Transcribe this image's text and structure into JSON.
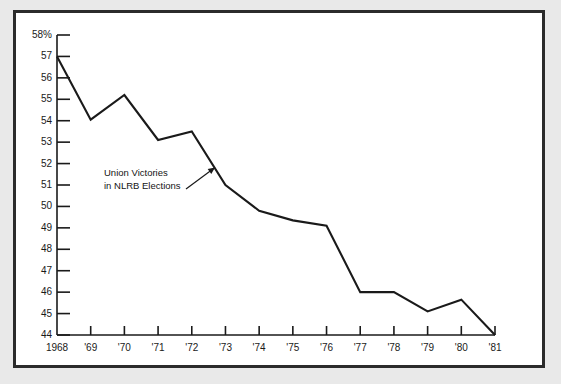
{
  "chart_data": {
    "type": "line",
    "title": "",
    "annotation": {
      "line1": "Union Victories",
      "line2": "in NLRB Elections"
    },
    "xlabel": "",
    "ylabel": "",
    "categories": [
      "1968",
      "'69",
      "'70",
      "'71",
      "'72",
      "'73",
      "'74",
      "'75",
      "'76",
      "'77",
      "'78",
      "'79",
      "'80",
      "'81"
    ],
    "values": [
      57.0,
      54.05,
      55.2,
      53.1,
      53.5,
      51.0,
      49.8,
      49.35,
      49.1,
      46.0,
      46.0,
      45.1,
      45.65,
      44.0
    ],
    "ylim": [
      44,
      58
    ],
    "ytick_labels": [
      "58%",
      "57",
      "56",
      "55",
      "54",
      "53",
      "52",
      "51",
      "50",
      "49",
      "48",
      "47",
      "46",
      "45",
      "44"
    ],
    "ytick_values": [
      58,
      57,
      56,
      55,
      54,
      53,
      52,
      51,
      50,
      49,
      48,
      47,
      46,
      45,
      44
    ],
    "xtick_labels": [
      "1968",
      "'69",
      "'70",
      "'71",
      "'72",
      "'73",
      "'74",
      "'75",
      "'76",
      "'77",
      "'78",
      "'79",
      "'80",
      "'81"
    ],
    "grid": false,
    "legend": "none",
    "line_color": "#1a1a1a",
    "axis_color": "#1a1a1a",
    "frame_color": "#2b2b2b",
    "background_color": "#ffffff",
    "page_background_color": "#e9e9e9"
  }
}
